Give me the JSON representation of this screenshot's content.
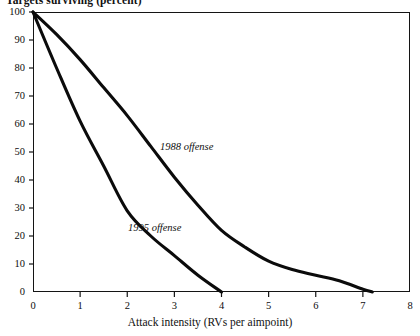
{
  "chart_data": {
    "type": "line",
    "title": "Targets surviving (percent)",
    "xlabel": "Attack intensity (RVs per aimpoint)",
    "ylabel": "Targets surviving (percent)",
    "xlim": [
      0,
      8
    ],
    "ylim": [
      0,
      100
    ],
    "grid": false,
    "legend_position": "inline-annotations",
    "xticks": [
      "0",
      "1",
      "2",
      "3",
      "4",
      "5",
      "6",
      "7",
      "8"
    ],
    "yticks": [
      "0",
      "10",
      "20",
      "30",
      "40",
      "50",
      "60",
      "70",
      "80",
      "90",
      "100"
    ],
    "series": [
      {
        "name": "1988 offense",
        "label": "1988 offense",
        "x": [
          0,
          0.5,
          1,
          1.5,
          2,
          2.5,
          3,
          3.5,
          4,
          4.5,
          5,
          5.5,
          6,
          6.5,
          7,
          7.2
        ],
        "values": [
          100,
          92,
          83,
          73,
          63,
          52,
          41,
          31,
          22,
          16,
          11,
          8,
          6,
          4,
          1,
          0
        ]
      },
      {
        "name": "1995 offense",
        "label": "1995 offense",
        "x": [
          0,
          0.5,
          1,
          1.5,
          2,
          2.5,
          3,
          3.5,
          4
        ],
        "values": [
          100,
          80,
          61,
          45,
          29,
          20,
          13,
          6,
          0
        ]
      }
    ],
    "annotations": [
      {
        "text": "1988 offense",
        "x": 2.7,
        "y": 47
      },
      {
        "text": "1995 offense",
        "x": 2.0,
        "y": 18
      }
    ],
    "line_color": "#0b0b0b"
  },
  "axis": {
    "x_title": "Attack intensity (RVs per aimpoint)",
    "y_title": "Targets surviving (percent)"
  }
}
